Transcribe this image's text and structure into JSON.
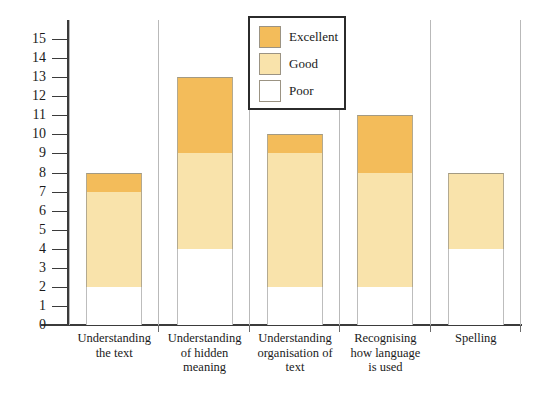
{
  "chart_data": {
    "type": "bar",
    "subtype": "stacked-bar",
    "title": "",
    "xlabel": "",
    "ylabel": "",
    "ylim": [
      0,
      15
    ],
    "y_axis_max_drawn": 16,
    "ytick_step": 1,
    "grid": false,
    "legend_position": "top-center-right",
    "categories": [
      "Understanding the text",
      "Understanding of hidden meaning",
      "Understanding organisation of text",
      "Recognising how language is used",
      "Spelling"
    ],
    "category_lines": [
      [
        "Understanding",
        "the text"
      ],
      [
        "Understanding",
        "of hidden",
        "meaning"
      ],
      [
        "Understanding",
        "organisation of",
        "text"
      ],
      [
        "Recognising",
        "how language",
        "is used"
      ],
      [
        "Spelling"
      ]
    ],
    "yticks": [
      0,
      1,
      2,
      3,
      4,
      5,
      6,
      7,
      8,
      9,
      10,
      11,
      12,
      13,
      14,
      15
    ],
    "series": [
      {
        "name": "Poor",
        "color": "#ffffff",
        "values": [
          2,
          4,
          2,
          2,
          4
        ]
      },
      {
        "name": "Good",
        "color": "#f9e3ab",
        "values": [
          5,
          5,
          7,
          6,
          4
        ]
      },
      {
        "name": "Excellent",
        "color": "#f3bc5a",
        "values": [
          1,
          4,
          1,
          3,
          0
        ]
      }
    ],
    "stack_order": [
      "Poor",
      "Good",
      "Excellent"
    ],
    "totals": [
      8,
      13,
      10,
      11,
      8
    ]
  },
  "legend": {
    "items": [
      {
        "label": "Excellent",
        "color": "#f3bc5a"
      },
      {
        "label": "Good",
        "color": "#f9e3ab"
      },
      {
        "label": "Poor",
        "color": "#ffffff"
      }
    ]
  },
  "colors": {
    "excellent": "#f3bc5a",
    "good": "#f9e3ab",
    "poor": "#ffffff",
    "axis": "#3b3b3b",
    "separator": "#b9b9b9",
    "bar_border": "#b3a98f",
    "background": "#ffffff"
  }
}
